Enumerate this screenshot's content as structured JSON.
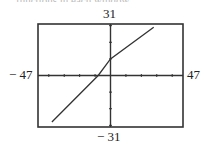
{
  "chart_data": {
    "type": "line",
    "title": "",
    "xlabel": "",
    "ylabel": "",
    "xlim": [
      -47,
      47
    ],
    "ylim": [
      -31,
      31
    ],
    "window_labels": {
      "ymax": "31",
      "ymin": "− 31",
      "xmin": "− 47",
      "xmax": "47"
    },
    "x_tick_step": 10,
    "y_tick_step": 10,
    "grid": false,
    "legend": null,
    "series": [
      {
        "name": "line",
        "x": [
          -38,
          -8,
          0,
          28
        ],
        "y": [
          -28,
          0,
          10,
          29
        ]
      }
    ],
    "axes_intercepts": {
      "x_intercept": -8,
      "y_intercept": 10
    },
    "frame": {
      "left_px": 38,
      "top_px": 24,
      "right_px": 183,
      "bottom_px": 127
    }
  },
  "caption_fragment": "functions in each window"
}
